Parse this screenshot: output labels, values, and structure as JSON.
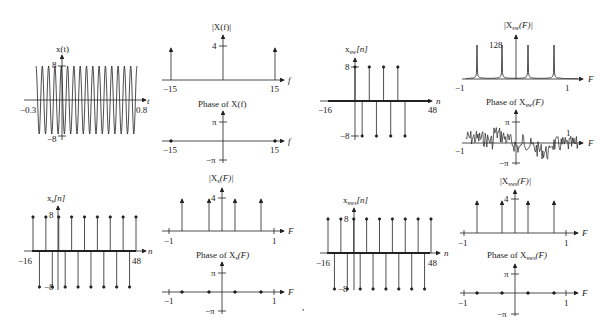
{
  "chart_data": [
    {
      "id": "x_t",
      "type": "line",
      "title": "x(t)",
      "xlabel": "t",
      "xlim": [
        -0.3,
        0.8
      ],
      "ylim": [
        -8,
        8
      ],
      "tick_labels": {
        "x": [
          "-0.3",
          "0.8"
        ],
        "y": [
          "8",
          "-8"
        ]
      },
      "signal": "8cos(2π·15t)",
      "cycles": 16
    },
    {
      "id": "mag_X_f",
      "type": "stem",
      "title": "|X(f)|",
      "xlabel": "f",
      "x": [
        -15,
        0,
        15
      ],
      "values": [
        4,
        4,
        4
      ],
      "tick_labels": {
        "x": [
          "-15",
          "15"
        ],
        "y": [
          "4"
        ]
      }
    },
    {
      "id": "phase_X_f",
      "type": "scatter",
      "title": "Phase of X(f)",
      "xlabel": "f",
      "x": [
        -15,
        15
      ],
      "values": [
        0,
        0
      ],
      "tick_labels": {
        "x": [
          "-15",
          "15"
        ],
        "y": [
          "π",
          "-π"
        ]
      }
    },
    {
      "id": "x_sw_n",
      "type": "stem",
      "title": "x_sw[n]",
      "xlabel": "n",
      "xlim": [
        -16,
        48
      ],
      "ylim": [
        -8,
        8
      ],
      "nonzero_range": [
        0,
        15
      ],
      "pattern": [
        8,
        -8
      ],
      "tick_labels": {
        "x": [
          "-16",
          "48"
        ],
        "y": [
          "8",
          "-8"
        ]
      }
    },
    {
      "id": "mag_X_sw_F",
      "type": "line",
      "title": "|X_sw(F)|",
      "xlabel": "F",
      "xlim": [
        -1,
        1
      ],
      "peaks_at": [
        -0.75,
        -0.25,
        0.25,
        0.75
      ],
      "peak_value": 128,
      "tick_labels": {
        "x": [
          "-1",
          "1"
        ],
        "y": [
          "128"
        ]
      }
    },
    {
      "id": "phase_X_sw_F",
      "type": "line",
      "title": "Phase of X_sw(F)",
      "xlabel": "F",
      "xlim": [
        -1,
        1
      ],
      "ylim": [
        -3.1416,
        3.1416
      ],
      "tick_labels": {
        "x": [
          "-1",
          "1"
        ],
        "y": [
          "π",
          "-π"
        ]
      }
    },
    {
      "id": "x_s_n",
      "type": "stem",
      "title": "x_s[n]",
      "xlabel": "n",
      "xlim": [
        -16,
        48
      ],
      "ylim": [
        -8,
        8
      ],
      "pattern": [
        8,
        -8
      ],
      "tick_labels": {
        "x": [
          "-16",
          "48"
        ],
        "y": [
          "8",
          "-8"
        ]
      }
    },
    {
      "id": "mag_X_s_F",
      "type": "stem",
      "title": "|X_s(F)|",
      "xlabel": "F",
      "x": [
        -0.75,
        -0.25,
        0.25,
        0.75
      ],
      "values": [
        4,
        4,
        4,
        4
      ],
      "tick_labels": {
        "x": [
          "-1",
          "1"
        ],
        "y": [
          "4"
        ]
      }
    },
    {
      "id": "phase_X_s_F",
      "type": "scatter",
      "title": "Phase of X_s(F)",
      "xlabel": "F",
      "x": [
        -0.75,
        -0.25,
        0.25,
        0.75
      ],
      "values": [
        0,
        0,
        0,
        0
      ],
      "tick_labels": {
        "x": [
          "-1",
          "1"
        ],
        "y": [
          "π",
          "-π"
        ]
      }
    },
    {
      "id": "x_sws_n",
      "type": "stem",
      "title": "x_sws[n]",
      "xlabel": "n",
      "xlim": [
        -16,
        48
      ],
      "ylim": [
        -8,
        8
      ],
      "pattern": [
        8,
        -8
      ],
      "tick_labels": {
        "x": [
          "-16",
          "48"
        ],
        "y": [
          "8",
          "-8"
        ]
      }
    },
    {
      "id": "mag_X_sws_F",
      "type": "stem",
      "title": "|X_sws(F)|",
      "xlabel": "F",
      "x": [
        -0.75,
        -0.25,
        0.25,
        0.75
      ],
      "values": [
        4,
        4,
        4,
        4
      ],
      "tick_labels": {
        "x": [
          "-1",
          "1"
        ],
        "y": [
          "4"
        ]
      }
    },
    {
      "id": "phase_X_sws_F",
      "type": "scatter",
      "title": "Phase of X_sws(F)",
      "xlabel": "F",
      "x": [
        -0.75,
        -0.25,
        0.25,
        0.75
      ],
      "values": [
        0,
        0,
        0,
        0
      ],
      "tick_labels": {
        "x": [
          "-1",
          "1"
        ],
        "y": [
          "π",
          "-π"
        ]
      }
    }
  ],
  "labels": {
    "xt_title": "x(t)",
    "xt_t": "t",
    "xt_xmin": "−0.3",
    "xt_xmax": "0.8",
    "xt_ymax": "8",
    "xt_ymin": "−8",
    "Xf_title": "|X(f)|",
    "Xf_f": "f",
    "Xf_xmin": "−15",
    "Xf_xmax": "15",
    "Xf_y": "4",
    "PXf_title": "Phase of X(f)",
    "PXf_f": "f",
    "PXf_xmin": "−15",
    "PXf_xmax": "15",
    "PXf_pi": "π",
    "PXf_mpi": "−π",
    "xsw_title": "x",
    "xsw_sub": "sw",
    "xsw_arg": "[n]",
    "xsw_n": "n",
    "xsw_xmin": "−16",
    "xsw_xmax": "48",
    "xsw_ymax": "8",
    "xsw_ymin": "−8",
    "Xsw_title": "|X",
    "Xsw_sub": "sw",
    "Xsw_arg": "(F)|",
    "Xsw_F": "F",
    "Xsw_xmin": "−1",
    "Xsw_xmax": "1",
    "Xsw_y": "128",
    "PXsw_title": "Phase of X",
    "PXsw_sub": "sw",
    "PXsw_arg": "(F)",
    "PXsw_F": "F",
    "PXsw_xmin": "−1",
    "PXsw_xmax": "1",
    "PXsw_pi": "π",
    "PXsw_mpi": "−π",
    "xs_title": "x",
    "xs_sub": "s",
    "xs_arg": "[n]",
    "xs_n": "n",
    "xs_xmin": "−16",
    "xs_xmax": "48",
    "xs_ymax": "8",
    "xs_ymin": "−8",
    "Xs_title": "|X",
    "Xs_sub": "s",
    "Xs_arg": "(F)|",
    "Xs_F": "F",
    "Xs_xmin": "−1",
    "Xs_xmax": "1",
    "Xs_y": "4",
    "PXs_title": "Phase of X",
    "PXs_sub": "s",
    "PXs_arg": "(F)",
    "PXs_F": "F",
    "PXs_xmin": "−1",
    "PXs_xmax": "1",
    "PXs_pi": "π",
    "PXs_mpi": "−π",
    "xsws_title": "x",
    "xsws_sub": "sws",
    "xsws_arg": "[n]",
    "xsws_n": "n",
    "xsws_xmin": "−16",
    "xsws_xmax": "48",
    "xsws_ymax": "8",
    "xsws_ymin": "−8",
    "Xsws_title": "|X",
    "Xsws_sub": "sws",
    "Xsws_arg": "(F)|",
    "Xsws_F": "F",
    "Xsws_xmin": "−1",
    "Xsws_xmax": "1",
    "Xsws_y": "4",
    "PXsws_title": "Phase of X",
    "PXsws_sub": "sws",
    "PXsws_arg": "(F)",
    "PXsws_F": "F",
    "PXsws_xmin": "−1",
    "PXsws_xmax": "1",
    "PXsws_pi": "π",
    "PXsws_mpi": "−π",
    "comma": ","
  }
}
